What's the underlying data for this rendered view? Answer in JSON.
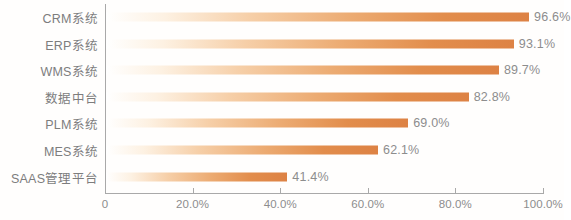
{
  "chart_data": {
    "type": "bar",
    "orientation": "horizontal",
    "title": "",
    "subtitle": "",
    "xlabel": "",
    "ylabel": "",
    "grid": false,
    "legend": null,
    "xlim": [
      0,
      100
    ],
    "x_tick_labels": [
      "0",
      "20.0%",
      "40.0%",
      "60.0%",
      "80.0%",
      "100.0%"
    ],
    "x_tick_values": [
      0,
      20,
      40,
      60,
      80,
      100
    ],
    "categories": [
      "CRM系统",
      "ERP系统",
      "WMS系统",
      "数据中台",
      "PLM系统",
      "MES系统",
      "SAAS管理平台"
    ],
    "values": [
      96.6,
      93.1,
      89.7,
      82.8,
      69.0,
      62.1,
      41.4
    ],
    "value_labels": [
      "96.6%",
      "93.1%",
      "89.7%",
      "82.8%",
      "69.0%",
      "62.1%",
      "41.4%"
    ],
    "series": [
      {
        "name": "",
        "values": [
          96.6,
          93.1,
          89.7,
          82.8,
          69.0,
          62.1,
          41.4
        ]
      }
    ],
    "bars": [
      {
        "category": "CRM系统",
        "value": 96.6,
        "label": "96.6%"
      },
      {
        "category": "ERP系统",
        "value": 93.1,
        "label": "93.1%"
      },
      {
        "category": "WMS系统",
        "value": 89.7,
        "label": "89.7%"
      },
      {
        "category": "数据中台",
        "value": 82.8,
        "label": "82.8%"
      },
      {
        "category": "PLM系统",
        "value": 69.0,
        "label": "69.0%"
      },
      {
        "category": "MES系统",
        "value": 62.1,
        "label": "62.1%"
      },
      {
        "category": "SAAS管理平台",
        "value": 41.4,
        "label": "41.4%"
      }
    ],
    "colors": {
      "bar_end": "#dd8244",
      "bar_mid": "#ecab72",
      "bar_start": "#ffffff",
      "axis": "#a9a9a9",
      "text": "#8d8d8d",
      "background": "#fffefd"
    }
  }
}
